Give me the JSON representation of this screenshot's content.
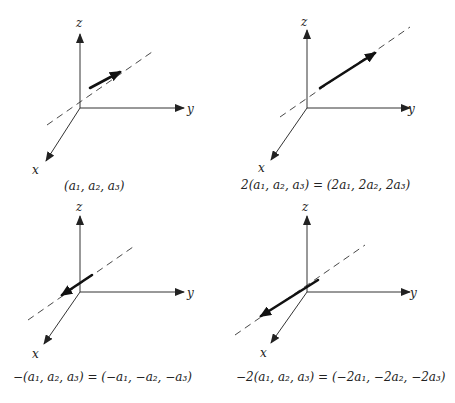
{
  "diagram": {
    "axis_labels": {
      "x": "x",
      "y": "y",
      "z": "z"
    },
    "panels": [
      {
        "id": "panel-1",
        "caption": "(a₁, a₂, a₃)",
        "scalar": "1",
        "direction": "along line, forward"
      },
      {
        "id": "panel-2",
        "caption": "2(a₁, a₂, a₃) = (2a₁, 2a₂, 2a₃)",
        "scalar": "2",
        "direction": "along line, forward, doubled length"
      },
      {
        "id": "panel-3",
        "caption": "−(a₁, a₂, a₃) = (−a₁, −a₂, −a₃)",
        "scalar": "-1",
        "direction": "along line, reversed"
      },
      {
        "id": "panel-4",
        "caption": "−2(a₁, a₂, a₃) = (−2a₁, −2a₂, −2a₃)",
        "scalar": "-2",
        "direction": "along line, reversed, doubled length"
      }
    ],
    "colors": {
      "line": "#333333",
      "vector": "#111111",
      "background": "#ffffff"
    }
  }
}
